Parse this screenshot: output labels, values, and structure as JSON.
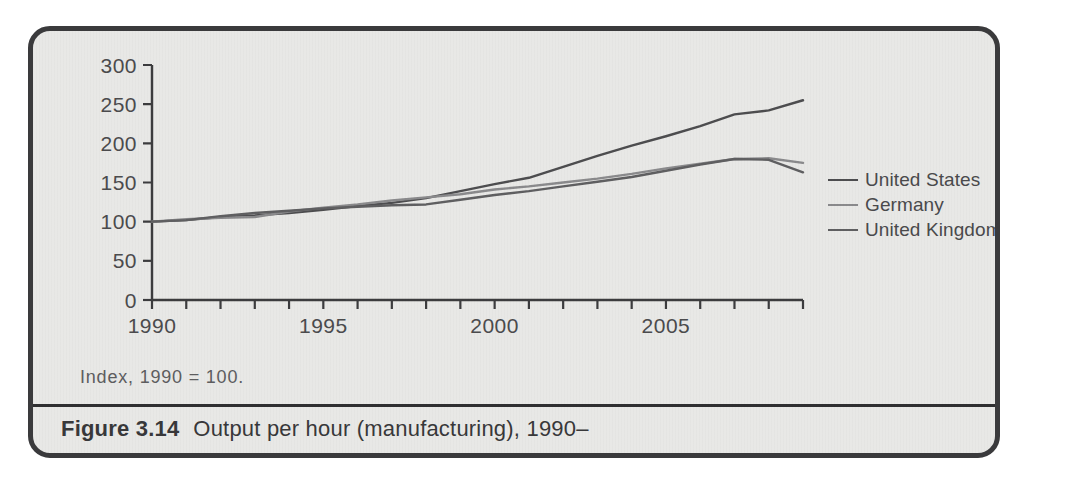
{
  "figure": {
    "caption_number": "Figure 3.14",
    "caption_text": "Output per hour (manufacturing), 1990–",
    "index_note": "Index, 1990 = 100.",
    "background_color": "#e8e8e6",
    "border_color": "#3a3a3c"
  },
  "legend": {
    "position": "right",
    "entries": [
      {
        "label": "United States",
        "color": "#4d4d4f",
        "width": 2.4
      },
      {
        "label": "Germany",
        "color": "#8a8a8c",
        "width": 2.4
      },
      {
        "label": "United Kingdom",
        "color": "#5f5f61",
        "width": 2.4
      }
    ]
  },
  "chart_data": {
    "type": "line",
    "title": "Output per hour (manufacturing), 1990–",
    "subtitle": "Index, 1990 = 100.",
    "xlabel": "",
    "ylabel": "",
    "xlim": [
      1990,
      2009
    ],
    "ylim": [
      0,
      300
    ],
    "yticks": [
      0,
      50,
      100,
      150,
      200,
      250,
      300
    ],
    "ytick_labels": [
      "0",
      "50",
      "100",
      "150",
      "200",
      "250",
      "300"
    ],
    "xticks": [
      1990,
      1991,
      1992,
      1993,
      1994,
      1995,
      1996,
      1997,
      1998,
      1999,
      2000,
      2001,
      2002,
      2003,
      2004,
      2005,
      2006,
      2007,
      2008,
      2009
    ],
    "xtick_labels_shown": [
      "1990",
      "1995",
      "2000",
      "2005"
    ],
    "xtick_labels_shown_at": [
      1990,
      1995,
      2000,
      2005
    ],
    "grid": false,
    "x": [
      1990,
      1991,
      1992,
      1993,
      1994,
      1995,
      1996,
      1997,
      1998,
      1999,
      2000,
      2001,
      2002,
      2003,
      2004,
      2005,
      2006,
      2007,
      2008,
      2009
    ],
    "series": [
      {
        "name": "United States",
        "color": "#4d4d4f",
        "values": [
          100,
          102,
          106,
          108,
          111,
          115,
          120,
          124,
          130,
          139,
          148,
          156,
          170,
          184,
          197,
          209,
          222,
          237,
          242,
          255
        ]
      },
      {
        "name": "Germany",
        "color": "#8a8a8c",
        "values": [
          100,
          103,
          105,
          106,
          113,
          118,
          122,
          127,
          131,
          135,
          141,
          145,
          150,
          155,
          161,
          168,
          174,
          180,
          181,
          175
        ]
      },
      {
        "name": "United Kingdom",
        "color": "#5f5f61",
        "values": [
          100,
          102,
          107,
          111,
          114,
          117,
          119,
          121,
          122,
          128,
          134,
          139,
          145,
          151,
          157,
          165,
          173,
          180,
          179,
          163
        ]
      }
    ]
  }
}
